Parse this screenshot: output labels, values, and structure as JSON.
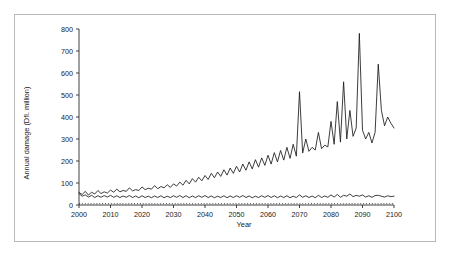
{
  "figure": {
    "border_color": "#b9b9b9",
    "background": "#ffffff"
  },
  "axis": {
    "x_title": "Year",
    "y_title": "Annual damage (Dfl. million)",
    "x_ticks": [
      "2000",
      "2010",
      "2020",
      "2030",
      "2040",
      "2050",
      "2060",
      "2070",
      "2080",
      "2090",
      "2100"
    ],
    "y_ticks": [
      "0",
      "100",
      "200",
      "300",
      "400",
      "500",
      "600",
      "700",
      "800"
    ]
  },
  "chart_data": {
    "type": "line",
    "title": "",
    "xlabel": "Year",
    "ylabel": "Annual damage (Dfl. million)",
    "xlim": [
      2000,
      2100
    ],
    "ylim": [
      0,
      800
    ],
    "grid": false,
    "legend": "none",
    "line_color": "#1a1a1a",
    "x": [
      2000,
      2001,
      2002,
      2003,
      2004,
      2005,
      2006,
      2007,
      2008,
      2009,
      2010,
      2011,
      2012,
      2013,
      2014,
      2015,
      2016,
      2017,
      2018,
      2019,
      2020,
      2021,
      2022,
      2023,
      2024,
      2025,
      2026,
      2027,
      2028,
      2029,
      2030,
      2031,
      2032,
      2033,
      2034,
      2035,
      2036,
      2037,
      2038,
      2039,
      2040,
      2041,
      2042,
      2043,
      2044,
      2045,
      2046,
      2047,
      2048,
      2049,
      2050,
      2051,
      2052,
      2053,
      2054,
      2055,
      2056,
      2057,
      2058,
      2059,
      2060,
      2061,
      2062,
      2063,
      2064,
      2065,
      2066,
      2067,
      2068,
      2069,
      2070,
      2071,
      2072,
      2073,
      2074,
      2075,
      2076,
      2077,
      2078,
      2079,
      2080,
      2081,
      2082,
      2083,
      2084,
      2085,
      2086,
      2087,
      2088,
      2089,
      2090,
      2091,
      2092,
      2093,
      2094,
      2095,
      2096,
      2097,
      2098,
      2099,
      2100
    ],
    "series": [
      {
        "name": "upper-damage-curve",
        "style": "solid",
        "values": [
          57,
          48,
          62,
          45,
          58,
          50,
          66,
          52,
          60,
          54,
          68,
          58,
          72,
          60,
          66,
          62,
          78,
          64,
          70,
          66,
          82,
          70,
          76,
          72,
          88,
          74,
          84,
          78,
          92,
          80,
          96,
          86,
          104,
          90,
          112,
          96,
          120,
          104,
          126,
          110,
          134,
          116,
          144,
          124,
          150,
          130,
          160,
          136,
          168,
          144,
          176,
          150,
          186,
          158,
          196,
          164,
          206,
          172,
          214,
          180,
          226,
          186,
          238,
          196,
          248,
          204,
          262,
          212,
          276,
          222,
          515,
          236,
          300,
          244,
          262,
          250,
          330,
          256,
          272,
          264,
          380,
          276,
          470,
          286,
          560,
          300,
          430,
          312,
          350,
          780,
          340,
          300,
          330,
          282,
          330,
          640,
          430,
          360,
          400,
          372,
          350
        ]
      },
      {
        "name": "lower-damage-curve",
        "style": "solid",
        "values": [
          52,
          40,
          46,
          36,
          44,
          34,
          42,
          35,
          43,
          36,
          44,
          35,
          42,
          34,
          41,
          35,
          43,
          34,
          41,
          33,
          42,
          34,
          40,
          33,
          41,
          34,
          42,
          33,
          40,
          34,
          42,
          35,
          43,
          34,
          42,
          33,
          41,
          34,
          42,
          35,
          43,
          34,
          41,
          33,
          40,
          34,
          42,
          33,
          41,
          34,
          42,
          35,
          43,
          34,
          41,
          33,
          40,
          34,
          42,
          35,
          43,
          34,
          42,
          33,
          41,
          34,
          42,
          33,
          40,
          34,
          46,
          35,
          42,
          34,
          41,
          33,
          44,
          34,
          41,
          35,
          46,
          36,
          48,
          35,
          44,
          40,
          50,
          38,
          44,
          40,
          46,
          36,
          42,
          35,
          43,
          44,
          40,
          36,
          42,
          38,
          40
        ]
      },
      {
        "name": "baseline-dotted-curve",
        "style": "dotted",
        "values": [
          6,
          6,
          6,
          6,
          6,
          6,
          6,
          6,
          6,
          6,
          6,
          6,
          6,
          6,
          6,
          6,
          6,
          6,
          6,
          6,
          6,
          6,
          6,
          6,
          6,
          6,
          6,
          6,
          6,
          6,
          6,
          6,
          6,
          6,
          6,
          6,
          6,
          6,
          6,
          6,
          6,
          6,
          6,
          6,
          6,
          6,
          6,
          6,
          6,
          6,
          6,
          6,
          6,
          6,
          6,
          6,
          6,
          6,
          6,
          6,
          6,
          6,
          6,
          6,
          6,
          6,
          6,
          6,
          6,
          6,
          6,
          6,
          6,
          6,
          6,
          6,
          6,
          6,
          6,
          6,
          6,
          6,
          6,
          6,
          6,
          6,
          6,
          6,
          6,
          6,
          6,
          6,
          6,
          6,
          6,
          6,
          6,
          6,
          6,
          6,
          6
        ]
      }
    ]
  }
}
